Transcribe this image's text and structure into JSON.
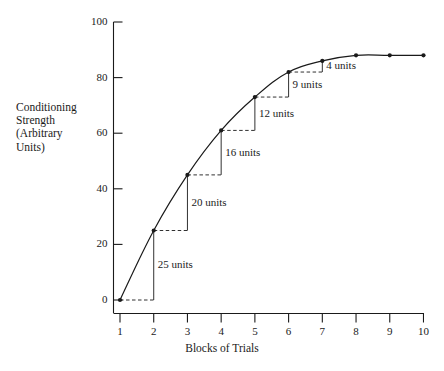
{
  "chart_data": {
    "type": "line",
    "title": "",
    "xlabel": "Blocks of Trials",
    "ylabel": "Conditioning Strength (Arbitrary Units)",
    "ylabel_lines": [
      "Conditioning",
      "Strength",
      "(Arbitrary",
      "Units)"
    ],
    "x": [
      1,
      2,
      3,
      4,
      5,
      6,
      7,
      8,
      9,
      10
    ],
    "values": [
      0,
      25,
      45,
      61,
      73,
      82,
      86,
      88,
      88,
      88
    ],
    "xlim": [
      1,
      10
    ],
    "ylim": [
      0,
      100
    ],
    "xticks": [
      "1",
      "2",
      "3",
      "4",
      "5",
      "6",
      "7",
      "8",
      "9",
      "10"
    ],
    "yticks": [
      "0",
      "20",
      "40",
      "60",
      "80",
      "100"
    ],
    "ytick_values": [
      0,
      20,
      40,
      60,
      80,
      100
    ],
    "grid": false,
    "legend": false,
    "marker": "filled-circle",
    "line_color": "#1a1a1a",
    "annotations": [
      {
        "label": "25 units",
        "from_x": 1,
        "to_x": 2,
        "from_y": 0,
        "to_y": 25,
        "delta": 25
      },
      {
        "label": "20 units",
        "from_x": 2,
        "to_x": 3,
        "from_y": 25,
        "to_y": 45,
        "delta": 20
      },
      {
        "label": "16 units",
        "from_x": 3,
        "to_x": 4,
        "from_y": 45,
        "to_y": 61,
        "delta": 16
      },
      {
        "label": "12 units",
        "from_x": 4,
        "to_x": 5,
        "from_y": 61,
        "to_y": 73,
        "delta": 12
      },
      {
        "label": "9 units",
        "from_x": 5,
        "to_x": 6,
        "from_y": 73,
        "to_y": 82,
        "delta": 9
      },
      {
        "label": "4 units",
        "from_x": 6,
        "to_x": 7,
        "from_y": 82,
        "to_y": 86,
        "delta": 4
      }
    ]
  }
}
